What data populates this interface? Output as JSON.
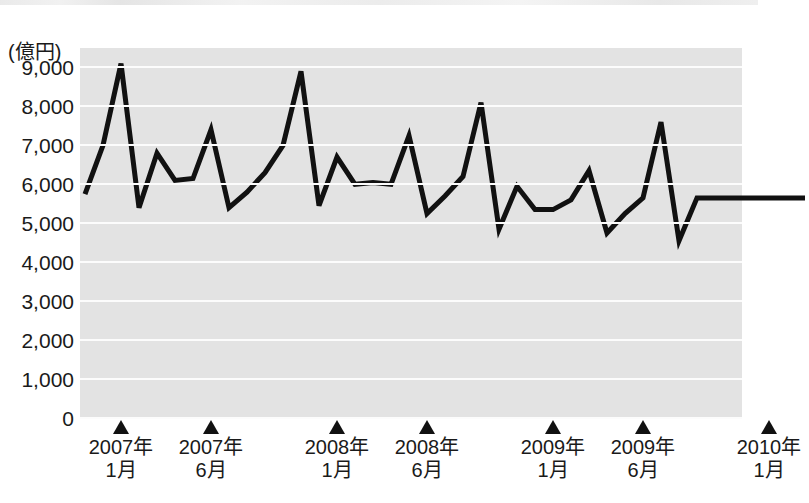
{
  "chart_data": {
    "type": "line",
    "title": "",
    "subtitle": "",
    "xlabel": "",
    "ylabel": "(億円)",
    "unit_label": "(億円)",
    "ylim": [
      0,
      9500
    ],
    "ytick_values": [
      0,
      1000,
      2000,
      3000,
      4000,
      5000,
      6000,
      7000,
      8000,
      9000
    ],
    "ytick_labels": [
      "0",
      "1,000",
      "2,000",
      "3,000",
      "4,000",
      "5,000",
      "6,000",
      "7,000",
      "8,000",
      "9,000"
    ],
    "grid": true,
    "grid_color": "#fcfcfc",
    "plot_background": "#e3e3e3",
    "line_color": "#111111",
    "line_width": 5,
    "legend": null,
    "legend_position": "none",
    "xtick_labels": [
      {
        "line1": "2007年",
        "line2": "1月",
        "index": 2
      },
      {
        "line1": "2007年",
        "line2": "6月",
        "index": 7
      },
      {
        "line1": "2008年",
        "line2": "1月",
        "index": 14
      },
      {
        "line1": "2008年",
        "line2": "6月",
        "index": 19
      },
      {
        "line1": "2009年",
        "line2": "1月",
        "index": 26
      },
      {
        "line1": "2009年",
        "line2": "6月",
        "index": 31
      },
      {
        "line1": "2010年",
        "line2": "1月",
        "index": 38
      }
    ],
    "x": [
      "2006-11",
      "2006-12",
      "2007-01",
      "2007-02",
      "2007-03",
      "2007-04",
      "2007-05",
      "2007-06",
      "2007-07",
      "2007-08",
      "2007-09",
      "2007-10",
      "2007-11",
      "2007-12",
      "2008-01",
      "2008-02",
      "2008-03",
      "2008-04",
      "2008-05",
      "2008-06",
      "2008-07",
      "2008-08",
      "2008-09",
      "2008-10",
      "2008-11",
      "2008-12",
      "2009-01",
      "2009-02",
      "2009-03",
      "2009-04",
      "2009-05",
      "2009-06",
      "2009-07",
      "2009-08",
      "2009-09",
      "2009-10",
      "2009-11",
      "2009-12",
      "2010-01",
      "2010-02",
      "2010-03"
    ],
    "values": [
      5750,
      7000,
      9100,
      5400,
      6800,
      6100,
      6150,
      7400,
      5400,
      5800,
      6300,
      7000,
      8900,
      5450,
      6700,
      6000,
      6050,
      6000,
      7250,
      5250,
      5700,
      6200,
      8100,
      4850,
      5950,
      5350,
      5350,
      5600,
      6350,
      4750,
      5250,
      5650,
      7600,
      4550,
      5650,
      5650,
      5650,
      5650,
      5650,
      5650,
      5650
    ],
    "series_name": ""
  }
}
